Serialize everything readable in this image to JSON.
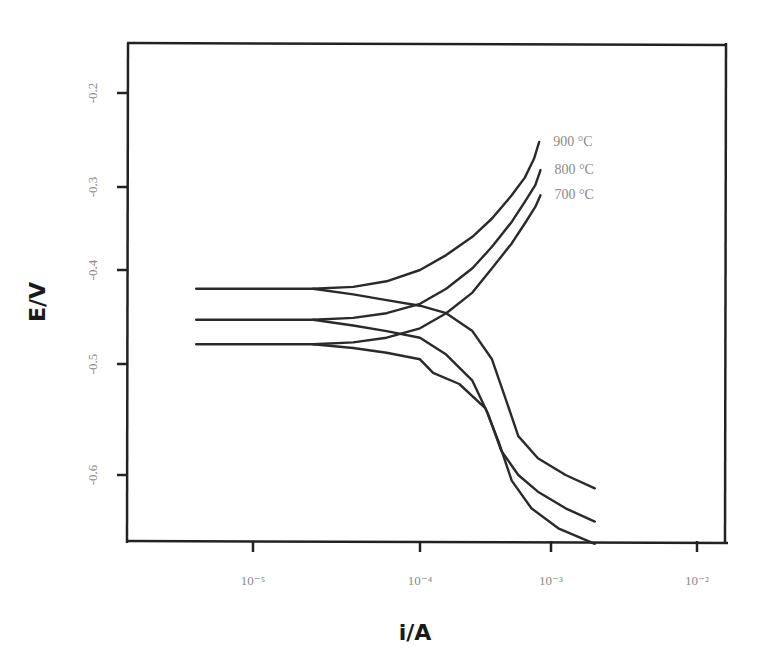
{
  "chart_data": {
    "type": "line",
    "title": "",
    "xlabel": "i/A",
    "ylabel": "E/V",
    "x_scale": "log",
    "x_ticks": [
      {
        "value": -5,
        "label": "10⁻⁵"
      },
      {
        "value": -4,
        "label": "10⁻⁴"
      },
      {
        "value": -3,
        "label": "10⁻³"
      },
      {
        "value": -2,
        "label": "10⁻²"
      }
    ],
    "y_ticks": [
      {
        "value": -0.2,
        "label": "-0.2"
      },
      {
        "value": -0.3,
        "label": "-0.3"
      },
      {
        "value": -0.4,
        "label": "-0.4"
      },
      {
        "value": -0.5,
        "label": "-0.5"
      },
      {
        "value": -0.6,
        "label": "-0.6"
      }
    ],
    "xlim_log10": [
      -5.75,
      -1.8
    ],
    "ylim": [
      -0.665,
      -0.14
    ],
    "grid": false,
    "legend": "inline labels at anodic branch ends",
    "series": [
      {
        "name": "900 °C",
        "label": "900 °C",
        "ecorr": -0.42,
        "anodic": [
          [
            -5.34,
            -0.42
          ],
          [
            -4.64,
            -0.42
          ],
          [
            -4.4,
            -0.418
          ],
          [
            -4.2,
            -0.412
          ],
          [
            -4.0,
            -0.4
          ],
          [
            -3.8,
            -0.382
          ],
          [
            -3.6,
            -0.36
          ],
          [
            -3.45,
            -0.338
          ],
          [
            -3.3,
            -0.31
          ],
          [
            -3.2,
            -0.29
          ],
          [
            -3.13,
            -0.27
          ],
          [
            -3.09,
            -0.252
          ]
        ],
        "cathodic": [
          [
            -4.64,
            -0.42
          ],
          [
            -4.4,
            -0.426
          ],
          [
            -4.2,
            -0.432
          ],
          [
            -4.0,
            -0.438
          ],
          [
            -3.8,
            -0.446
          ],
          [
            -3.6,
            -0.465
          ],
          [
            -3.45,
            -0.495
          ],
          [
            -3.35,
            -0.53
          ],
          [
            -3.25,
            -0.565
          ],
          [
            -3.1,
            -0.585
          ],
          [
            -2.9,
            -0.6
          ],
          [
            -2.7,
            -0.612
          ]
        ]
      },
      {
        "name": "800 °C",
        "label": "800 °C",
        "ecorr": -0.453,
        "anodic": [
          [
            -5.34,
            -0.453
          ],
          [
            -4.64,
            -0.453
          ],
          [
            -4.4,
            -0.451
          ],
          [
            -4.2,
            -0.446
          ],
          [
            -4.0,
            -0.436
          ],
          [
            -3.8,
            -0.42
          ],
          [
            -3.6,
            -0.398
          ],
          [
            -3.45,
            -0.372
          ],
          [
            -3.3,
            -0.342
          ],
          [
            -3.2,
            -0.318
          ],
          [
            -3.12,
            -0.298
          ],
          [
            -3.08,
            -0.282
          ]
        ],
        "cathodic": [
          [
            -4.64,
            -0.453
          ],
          [
            -4.4,
            -0.459
          ],
          [
            -4.2,
            -0.465
          ],
          [
            -4.0,
            -0.472
          ],
          [
            -3.8,
            -0.49
          ],
          [
            -3.6,
            -0.515
          ],
          [
            -3.48,
            -0.545
          ],
          [
            -3.38,
            -0.578
          ],
          [
            -3.25,
            -0.6
          ],
          [
            -3.1,
            -0.615
          ],
          [
            -2.9,
            -0.63
          ],
          [
            -2.7,
            -0.642
          ]
        ]
      },
      {
        "name": "700 °C",
        "label": "700 °C",
        "ecorr": -0.479,
        "anodic": [
          [
            -5.34,
            -0.479
          ],
          [
            -4.64,
            -0.479
          ],
          [
            -4.4,
            -0.477
          ],
          [
            -4.2,
            -0.472
          ],
          [
            -4.0,
            -0.462
          ],
          [
            -3.8,
            -0.446
          ],
          [
            -3.6,
            -0.424
          ],
          [
            -3.45,
            -0.398
          ],
          [
            -3.3,
            -0.368
          ],
          [
            -3.2,
            -0.344
          ],
          [
            -3.12,
            -0.324
          ],
          [
            -3.08,
            -0.31
          ]
        ],
        "cathodic": [
          [
            -4.64,
            -0.479
          ],
          [
            -4.4,
            -0.483
          ],
          [
            -4.2,
            -0.488
          ],
          [
            -4.0,
            -0.495
          ],
          [
            -3.9,
            -0.508
          ],
          [
            -3.7,
            -0.518
          ],
          [
            -3.5,
            -0.54
          ],
          [
            -3.4,
            -0.57
          ],
          [
            -3.3,
            -0.605
          ],
          [
            -3.15,
            -0.63
          ],
          [
            -2.95,
            -0.648
          ],
          [
            -2.7,
            -0.662
          ]
        ]
      }
    ]
  },
  "labels": {
    "xlabel": "i/A",
    "ylabel": "E/V"
  }
}
